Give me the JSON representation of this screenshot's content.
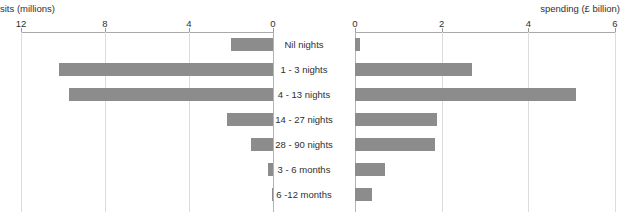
{
  "chart_data": {
    "type": "bar",
    "orientation": "horizontal-back-to-back",
    "title": "",
    "categories": [
      "Nil nights",
      "1 - 3 nights",
      "4 - 13 nights",
      "14 - 27 nights",
      "28 - 90 nights",
      "3 - 6 months",
      "6 -12 months"
    ],
    "series": [
      {
        "name": "sits (millions)",
        "side": "left",
        "axis_label": "sits (millions)",
        "ticks": [
          12,
          8,
          4,
          0
        ],
        "tick_labels": [
          "12",
          "8",
          "4",
          "0"
        ],
        "xlim": [
          12,
          0
        ],
        "reversed": true,
        "values": [
          2.0,
          10.2,
          9.7,
          2.2,
          1.05,
          0.25,
          0.05
        ]
      },
      {
        "name": "spending (£ billion)",
        "side": "right",
        "axis_label": "spending (£ billion)",
        "ticks": [
          0,
          2,
          4,
          6
        ],
        "tick_labels": [
          "0",
          "2",
          "4",
          "6"
        ],
        "xlim": [
          0,
          6
        ],
        "reversed": false,
        "values": [
          0.12,
          2.7,
          5.1,
          1.9,
          1.85,
          0.7,
          0.4
        ]
      }
    ],
    "grid": true,
    "legend": "none",
    "bar_color": "#8c8c8c",
    "gridline_color": "#dcdcdc",
    "axis_color": "#aaaaaa"
  }
}
